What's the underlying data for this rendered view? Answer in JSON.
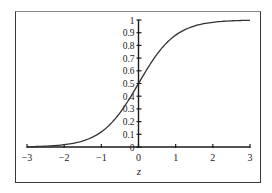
{
  "chart_data": {
    "type": "line",
    "title": "",
    "xlabel": "z",
    "ylabel": "",
    "xlim": [
      -3,
      3
    ],
    "ylim": [
      0,
      1
    ],
    "grid": false,
    "legend": null,
    "x_ticks": [
      "−3",
      "−2",
      "−1",
      "0",
      "1",
      "2",
      "3"
    ],
    "y_ticks": [
      "0",
      "0.1",
      "0.2",
      "0.3",
      "0.4",
      "0.5",
      "0.6",
      "0.7",
      "0.8",
      "0.9",
      "1"
    ],
    "function": "1/(1+exp(-2z))",
    "series": [
      {
        "name": "logistic",
        "x": [
          -3,
          -2.5,
          -2,
          -1.5,
          -1,
          -0.5,
          0,
          0.5,
          1,
          1.5,
          2,
          2.5,
          3
        ],
        "values": [
          0.002,
          0.007,
          0.018,
          0.047,
          0.119,
          0.269,
          0.5,
          0.731,
          0.881,
          0.953,
          0.982,
          0.993,
          0.998
        ]
      }
    ]
  },
  "colors": {
    "curve": "#333333",
    "axis": "#1a1a1a",
    "frame": "#3a3a3a",
    "background": "#ffffff"
  }
}
